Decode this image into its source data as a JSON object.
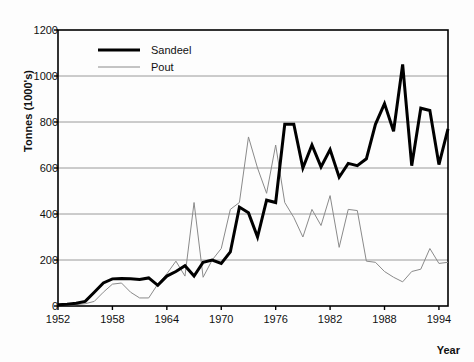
{
  "chart_data": {
    "type": "line",
    "title": "",
    "xlabel": "Year",
    "ylabel": "Tonnes (1000's)",
    "xlim": [
      1952,
      1995
    ],
    "ylim": [
      0,
      1200
    ],
    "yticks": [
      0,
      200,
      400,
      600,
      800,
      1000,
      1200
    ],
    "xticks": [
      1952,
      1958,
      1964,
      1970,
      1976,
      1982,
      1988,
      1994
    ],
    "grid": "horizontal",
    "legend_position": "top-left-inside",
    "x": [
      1952,
      1953,
      1954,
      1955,
      1956,
      1957,
      1958,
      1959,
      1960,
      1961,
      1962,
      1963,
      1964,
      1965,
      1966,
      1967,
      1968,
      1969,
      1970,
      1971,
      1972,
      1973,
      1974,
      1975,
      1976,
      1977,
      1978,
      1979,
      1980,
      1981,
      1982,
      1983,
      1984,
      1985,
      1986,
      1987,
      1988,
      1989,
      1990,
      1991,
      1992,
      1993,
      1994,
      1995
    ],
    "series": [
      {
        "name": "Sandeel",
        "color": "#000000",
        "linewidth": 3,
        "values": [
          5,
          8,
          12,
          20,
          60,
          100,
          118,
          120,
          118,
          115,
          122,
          90,
          130,
          150,
          175,
          130,
          190,
          200,
          185,
          235,
          430,
          405,
          300,
          460,
          450,
          790,
          790,
          600,
          700,
          605,
          680,
          560,
          620,
          610,
          640,
          790,
          880,
          760,
          1050,
          610,
          860,
          850,
          615,
          770
        ]
      },
      {
        "name": "Pout",
        "color": "#8a8a8a",
        "linewidth": 1,
        "values": [
          2,
          4,
          6,
          10,
          20,
          60,
          95,
          100,
          60,
          35,
          35,
          95,
          140,
          195,
          130,
          450,
          125,
          200,
          250,
          420,
          450,
          735,
          600,
          490,
          700,
          450,
          385,
          300,
          420,
          350,
          480,
          255,
          420,
          415,
          195,
          190,
          150,
          125,
          105,
          150,
          160,
          250,
          185,
          190
        ]
      }
    ]
  },
  "legend": {
    "items": [
      {
        "label": "Sandeel"
      },
      {
        "label": "Pout"
      }
    ]
  }
}
